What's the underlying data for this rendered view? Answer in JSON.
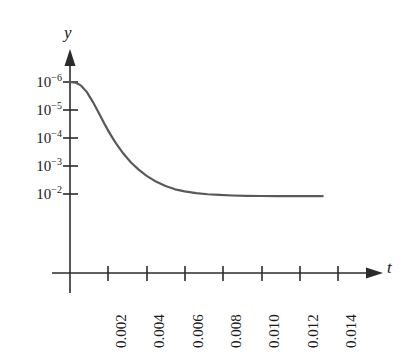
{
  "chart_data": {
    "type": "line",
    "title": "",
    "subtitle": "",
    "xlabel": "t",
    "ylabel": "y",
    "grid": false,
    "legend": null,
    "y_axis": {
      "scale": "log-inverted",
      "note": "logarithmic, values increase downward",
      "tick_labels": [
        "10−6",
        "10−5",
        "10−4",
        "10−3",
        "10−2"
      ],
      "tick_mantissas": [
        10,
        10,
        10,
        10,
        10
      ],
      "tick_exponents": [
        -6,
        -5,
        -4,
        -3,
        -2
      ],
      "tick_values": [
        1e-06,
        1e-05,
        0.0001,
        0.001,
        0.01
      ],
      "ylim": [
        1e-06,
        0.01
      ]
    },
    "x_axis": {
      "scale": "linear",
      "tick_labels": [
        "0.002",
        "0.004",
        "0.006",
        "0.008",
        "0.010",
        "0.012",
        "0.014"
      ],
      "tick_values": [
        0.002,
        0.004,
        0.006,
        0.008,
        0.01,
        0.012,
        0.014
      ],
      "tick_label_rotation": -90,
      "xlim": [
        0,
        0.0155
      ]
    },
    "series": [
      {
        "name": "y(t)",
        "color": "#595959",
        "linewidth": 2.2,
        "x": [
          0.0,
          0.0003,
          0.0006,
          0.0009,
          0.0012,
          0.0015,
          0.0018,
          0.0021,
          0.0024,
          0.0028,
          0.0032,
          0.0036,
          0.004,
          0.0045,
          0.005,
          0.0055,
          0.006,
          0.0066,
          0.0072,
          0.0078,
          0.0085,
          0.0092,
          0.01,
          0.0108,
          0.0116,
          0.0124,
          0.0132
        ],
        "y": [
          1e-06,
          1.05e-06,
          1.35e-06,
          2.3e-06,
          5e-06,
          1.2e-05,
          3e-05,
          7e-05,
          0.00015,
          0.00036,
          0.00075,
          0.00135,
          0.0022,
          0.0036,
          0.0052,
          0.0068,
          0.0081,
          0.0093,
          0.0102,
          0.0108,
          0.0113,
          0.0116,
          0.0118,
          0.0119,
          0.01195,
          0.01198,
          0.012
        ]
      }
    ],
    "annotations": []
  },
  "axes": {
    "y_arrow_label": "y",
    "t_arrow_label": "t"
  },
  "style": {
    "background": "#ffffff",
    "axis_color": "#2b2b2b",
    "curve_color": "#595959",
    "text_color": "#1a1a1a"
  }
}
